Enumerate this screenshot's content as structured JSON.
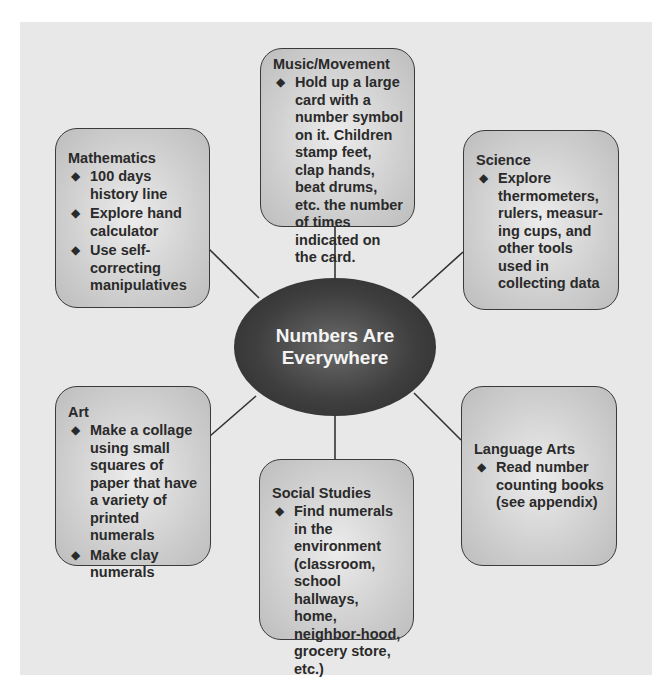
{
  "diagram": {
    "type": "web-concept-map",
    "center": {
      "title": "Numbers Are Everywhere"
    },
    "nodes": [
      {
        "id": "music",
        "title": "Music/Movement",
        "items": [
          "Hold up a large card with a number symbol on it. Children stamp feet, clap hands, beat drums, etc. the number of times indicated on the card."
        ]
      },
      {
        "id": "mathematics",
        "title": "Mathematics",
        "items": [
          "100 days history line",
          "Explore hand calculator",
          "Use self-correcting manipulatives"
        ]
      },
      {
        "id": "science",
        "title": "Science",
        "items": [
          "Explore thermometers, rulers, measur-ing cups, and other tools used in collecting data"
        ]
      },
      {
        "id": "art",
        "title": "Art",
        "items": [
          "Make a collage using small squares of paper that have a variety of printed numerals",
          "Make clay numerals"
        ]
      },
      {
        "id": "language-arts",
        "title": "Language Arts",
        "items": [
          "Read number counting books (see appendix)"
        ]
      },
      {
        "id": "social-studies",
        "title": "Social Studies",
        "items": [
          "Find numerals in the environment (classroom, school hallways, home, neighbor-hood, grocery store, etc.)"
        ]
      }
    ],
    "bullet_glyph": "◆",
    "colors": {
      "panel": "#e8e8e8",
      "box_fill": "#d0d0d0",
      "box_border": "#3a3a3a",
      "hub_fill": "#3f3f3f",
      "hub_text": "#f4f4f4",
      "connector": "#333333"
    }
  }
}
